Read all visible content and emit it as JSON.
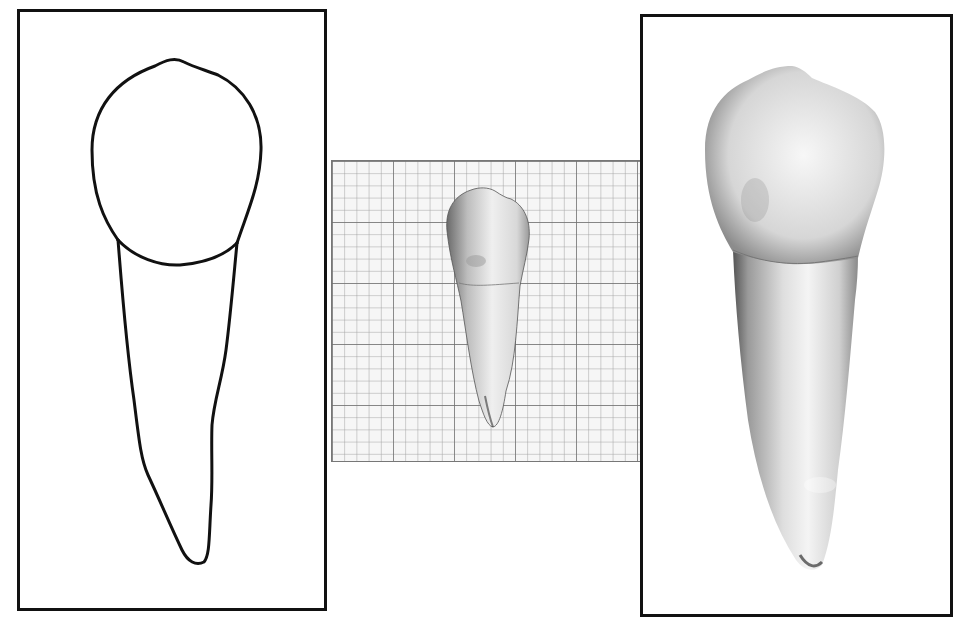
{
  "figure": {
    "panels": [
      {
        "id": "outline",
        "label": "Outline drawing of tooth (crown and root)"
      },
      {
        "id": "grid",
        "label": "Tooth specimen on millimeter graph paper",
        "grid": {
          "minor_cell_px": 12.2,
          "major_every": 5
        }
      },
      {
        "id": "photo",
        "label": "Enlarged photograph of tooth (crown and root)"
      }
    ]
  },
  "colors": {
    "frame": "#111111",
    "grid_minor": "#9a9a9a",
    "grid_major": "#6a6a6a",
    "paper": "#f4f4f4",
    "tooth_light": "#f2f2f2",
    "tooth_mid": "#c8c8c8",
    "tooth_dark": "#5a5a5a"
  }
}
